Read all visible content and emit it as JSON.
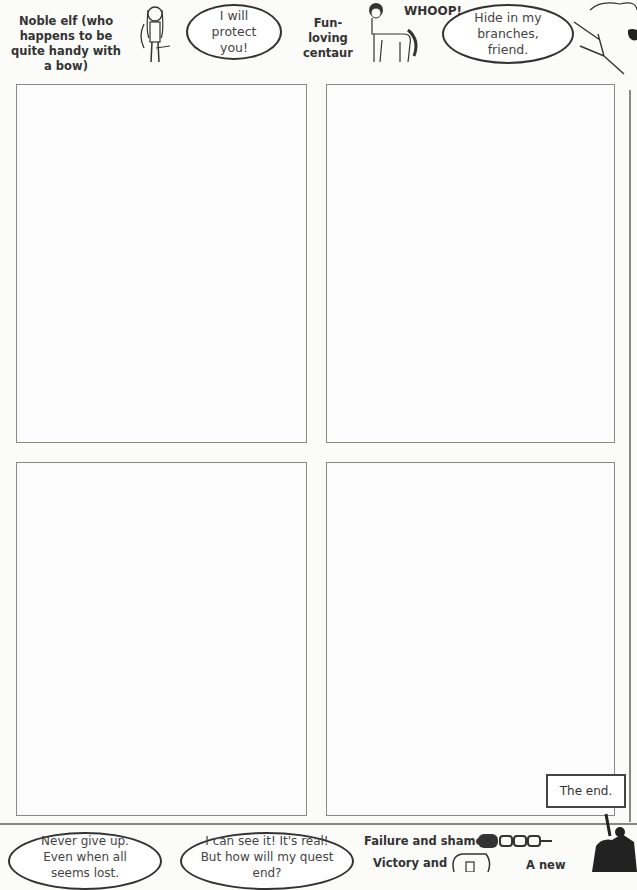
{
  "top": {
    "elf_caption": "Noble elf (who happens to be quite handy with a bow)",
    "elf_speech": "I will protect you!",
    "centaur_caption": "Fun-loving centaur",
    "centaur_shout": "WHOOP!",
    "tree_speech": "Hide in my branches, friend."
  },
  "panels": [
    {
      "name": "panel-top-left"
    },
    {
      "name": "panel-top-right"
    },
    {
      "name": "panel-bottom-left"
    },
    {
      "name": "panel-bottom-right"
    }
  ],
  "end_label": "The end.",
  "bottom": {
    "bubble1": "Never give up. Even when all seems lost.",
    "bubble2": "I can see it! It's real! But how will my quest end?",
    "failure": "Failure and shame?",
    "victory": "Victory and",
    "new": "A new"
  }
}
